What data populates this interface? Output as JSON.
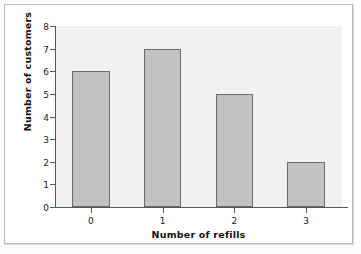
{
  "chart_data": {
    "type": "bar",
    "title": "",
    "xlabel": "Number of refills",
    "ylabel": "Number of customers",
    "categories": [
      "0",
      "1",
      "2",
      "3"
    ],
    "values": [
      6,
      7,
      5,
      2
    ],
    "ylim": [
      0,
      8
    ],
    "yticks": [
      "0",
      "1",
      "2",
      "3",
      "4",
      "5",
      "6",
      "7",
      "8"
    ],
    "grid": false,
    "legend": "none",
    "bar_color": "#c2c2c2",
    "bar_edge_color": "#6b6b6b",
    "plot_background": "#f1f1f1",
    "axis_color": "#585858",
    "series": [
      {
        "name": "Number of customers",
        "values": [
          6,
          7,
          5,
          2
        ]
      }
    ]
  }
}
